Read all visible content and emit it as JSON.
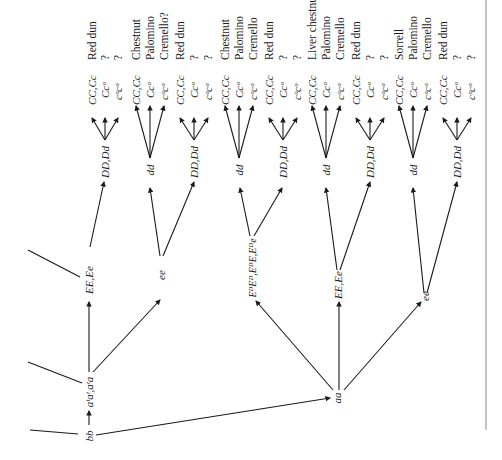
{
  "diagram": {
    "title": "",
    "phenotypes": [
      "Red dun",
      "?",
      "?",
      "Chestnut",
      "Palomino",
      "Cremello?",
      "Red dun",
      "?",
      "?",
      "Chestnut",
      "Palomino",
      "Cremello",
      "Red dun",
      "?",
      "?",
      "Liver chestnut",
      "Palomino",
      "Cremello",
      "Red dun",
      "?",
      "?",
      "Sorrell",
      "Palomino",
      "Cremello",
      "Red dun",
      "?",
      "?"
    ],
    "leaf_genotypes": [
      "CC,Cc",
      "Ccᵒ",
      "cᵒcᵒ",
      "CC,Cc",
      "Ccᵒ",
      "cᵒcᵒ",
      "CC,Cc",
      "Ccᵒ",
      "cᵒcᵒ",
      "CC,Cc",
      "Ccᵒ",
      "cᵒcᵒ",
      "CC,Cc",
      "Ccᵒ",
      "cᵒcᵒ",
      "CC,Cc",
      "Ccᵒ",
      "cᵒcᵒ",
      "CC,Cc",
      "Ccᵒ",
      "cᵒcᵒ",
      "CC,Cc",
      "Ccᵒ",
      "cᵒcᵒ",
      "CC,Cc",
      "Ccᵒ",
      "cᵒcᵒ"
    ],
    "d_nodes": [
      "DD,Dd",
      "dd",
      "DD,Dd",
      "dd",
      "DD,Dd",
      "dd",
      "DD,Dd",
      "dd",
      "DD,Dd"
    ],
    "e_nodes": [
      "EE,Ee",
      "ee",
      "EᴰEᴰ,EᴰE,Eᴰe",
      "EE,Ee",
      "ee"
    ],
    "a_nodes": [
      "aᵗaᵗ,aᵗa",
      "aa"
    ],
    "root": "bb"
  }
}
